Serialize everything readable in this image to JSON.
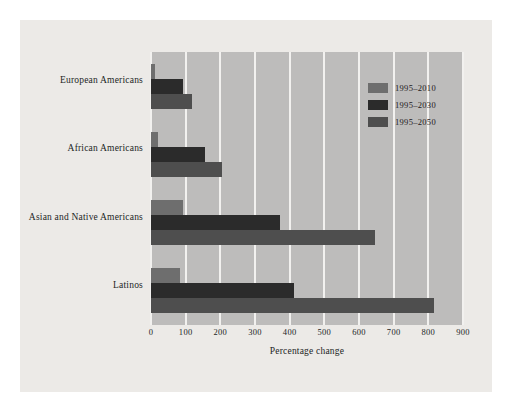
{
  "figure": {
    "panel_background": "#eceae7",
    "plot_background": "#bdbcbb",
    "gridline_color": "#f2f1ef"
  },
  "chart_data": {
    "type": "bar",
    "orientation": "horizontal",
    "title": "",
    "subtitle": "",
    "xlabel": "Percentage change",
    "ylabel": "",
    "xlim": [
      0,
      900
    ],
    "xticks": [
      0,
      100,
      200,
      300,
      400,
      500,
      600,
      700,
      800,
      900
    ],
    "xticklabels": [
      "0",
      "100",
      "200",
      "300",
      "400",
      "500",
      "600",
      "700",
      "800",
      "900"
    ],
    "grid": "vertical",
    "legend_position": "upper right",
    "categories": [
      "European Americans",
      "African Americans",
      "Asian and Native Americans",
      "Latinos"
    ],
    "series": [
      {
        "name": "1995–2010",
        "color": "#6e6e6e",
        "values": [
          11,
          21,
          93,
          85
        ]
      },
      {
        "name": "1995–2030",
        "color": "#2b2b2b",
        "values": [
          92,
          155,
          373,
          412
        ]
      },
      {
        "name": "1995–2050",
        "color": "#4e4e4e",
        "values": [
          119,
          205,
          645,
          815
        ]
      }
    ]
  }
}
